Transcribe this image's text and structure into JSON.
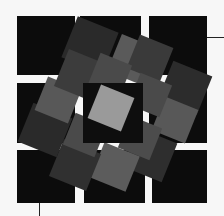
{
  "artwork": {
    "background": "#f7f7f7",
    "grid_squares": [
      {
        "x": 17,
        "y": 16,
        "w": 58,
        "h": 59,
        "fill": "#0c0c0c"
      },
      {
        "x": 80,
        "y": 16,
        "w": 61,
        "h": 59,
        "fill": "#0c0c0c"
      },
      {
        "x": 149,
        "y": 16,
        "w": 58,
        "h": 59,
        "fill": "#0c0c0c"
      },
      {
        "x": 17,
        "y": 83,
        "w": 58,
        "h": 60,
        "fill": "#0c0c0c"
      },
      {
        "x": 149,
        "y": 83,
        "w": 58,
        "h": 60,
        "fill": "#0c0c0c"
      },
      {
        "x": 17,
        "y": 150,
        "w": 58,
        "h": 53,
        "fill": "#0c0c0c"
      },
      {
        "x": 84,
        "y": 150,
        "w": 61,
        "h": 53,
        "fill": "#0c0c0c"
      },
      {
        "x": 152,
        "y": 150,
        "w": 55,
        "h": 53,
        "fill": "#0c0c0c"
      }
    ],
    "ring_tiles": [
      {
        "cx": 90,
        "cy": 45,
        "s": 44,
        "rot": 22,
        "fill": "#2a2a2a"
      },
      {
        "cx": 133,
        "cy": 60,
        "s": 40,
        "rot": 22,
        "fill": "#5a5a5a"
      },
      {
        "cx": 150,
        "cy": 58,
        "s": 36,
        "rot": 22,
        "fill": "#3a3a3a"
      },
      {
        "cx": 185,
        "cy": 88,
        "s": 42,
        "rot": 22,
        "fill": "#2c2c2c"
      },
      {
        "cx": 175,
        "cy": 120,
        "s": 36,
        "rot": 22,
        "fill": "#585858"
      },
      {
        "cx": 150,
        "cy": 155,
        "s": 42,
        "rot": 22,
        "fill": "#2e2e2e"
      },
      {
        "cx": 115,
        "cy": 167,
        "s": 38,
        "rot": 22,
        "fill": "#5c5c5c"
      },
      {
        "cx": 75,
        "cy": 165,
        "s": 40,
        "rot": 22,
        "fill": "#303030"
      },
      {
        "cx": 45,
        "cy": 130,
        "s": 42,
        "rot": 22,
        "fill": "#2a2a2a"
      },
      {
        "cx": 58,
        "cy": 100,
        "s": 36,
        "rot": 22,
        "fill": "#585858"
      },
      {
        "cx": 80,
        "cy": 75,
        "s": 40,
        "rot": 22,
        "fill": "#3c3c3c"
      },
      {
        "cx": 110,
        "cy": 75,
        "s": 34,
        "rot": 22,
        "fill": "#4a4a4a"
      },
      {
        "cx": 150,
        "cy": 95,
        "s": 34,
        "rot": 22,
        "fill": "#4a4a4a"
      },
      {
        "cx": 140,
        "cy": 138,
        "s": 34,
        "rot": 22,
        "fill": "#4c4c4c"
      },
      {
        "cx": 85,
        "cy": 135,
        "s": 34,
        "rot": 22,
        "fill": "#4a4a4a"
      }
    ],
    "center_square": {
      "x": 83,
      "y": 83,
      "w": 60,
      "h": 60,
      "fill": "#0e0e0e"
    },
    "center_tile": {
      "cx": 111,
      "cy": 108,
      "s": 36,
      "rot": 22,
      "fill": "#9a9a9a"
    },
    "leader_lines": [
      {
        "x": 207,
        "y": 37,
        "w": 17,
        "h": 1
      },
      {
        "x": 39,
        "y": 203,
        "w": 1,
        "h": 13
      }
    ]
  }
}
